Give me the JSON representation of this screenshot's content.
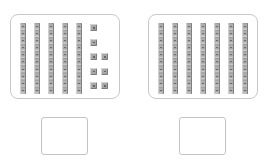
{
  "problems": [
    {
      "id": "left",
      "tens_rods": 5,
      "ones_cubes": 8,
      "ones_columns": [
        5,
        3
      ],
      "answer_value": ""
    },
    {
      "id": "right",
      "tens_rods": 7,
      "ones_cubes": 0,
      "ones_columns": [],
      "answer_value": ""
    }
  ],
  "colors": {
    "panel_border": "#c8c8c8",
    "block_gray": "#a8a8a8",
    "answer_border": "#c4c4c4"
  }
}
